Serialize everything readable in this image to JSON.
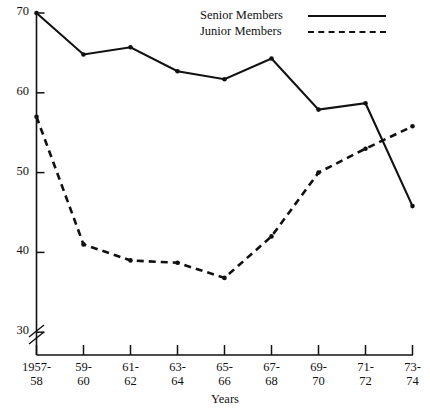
{
  "chart_data": {
    "type": "line",
    "title": "",
    "xlabel": "Years",
    "ylabel": "",
    "categories": [
      "1957-58",
      "59-60",
      "61-62",
      "63-64",
      "65-66",
      "67-68",
      "69-70",
      "71-72",
      "73-74"
    ],
    "category_lines": [
      [
        "1957-",
        "58"
      ],
      [
        "59-",
        "60"
      ],
      [
        "61-",
        "62"
      ],
      [
        "63-",
        "64"
      ],
      [
        "65-",
        "66"
      ],
      [
        "67-",
        "68"
      ],
      [
        "69-",
        "70"
      ],
      [
        "71-",
        "72"
      ],
      [
        "73-",
        "74"
      ]
    ],
    "series": [
      {
        "name": "Senior Members",
        "style": "solid",
        "color": "#111111",
        "values": [
          70.0,
          64.8,
          65.7,
          62.7,
          61.7,
          64.3,
          57.9,
          58.7,
          45.8
        ]
      },
      {
        "name": "Junior Members",
        "style": "dashed",
        "color": "#111111",
        "values": [
          57.0,
          41.0,
          39.0,
          38.7,
          36.8,
          42.0,
          50.0,
          53.0,
          55.8
        ]
      }
    ],
    "ylim": [
      27.5,
      70.5
    ],
    "yticks": [
      30,
      40,
      50,
      60,
      70
    ],
    "ytick_labels": [
      "30",
      "40",
      "50",
      "60",
      "70"
    ],
    "grid": false,
    "legend_position": "top-right",
    "axis_break": "double-slash below 30"
  },
  "legend": {
    "entries": [
      {
        "label": "Senior Members",
        "style": "solid"
      },
      {
        "label": "Junior Members",
        "style": "dashed"
      }
    ]
  },
  "axes": {
    "x_title": "Years"
  }
}
